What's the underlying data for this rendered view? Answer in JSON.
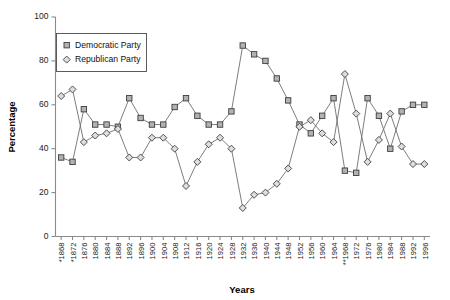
{
  "chart_data": {
    "type": "line",
    "title": "",
    "xlabel": "Years",
    "ylabel": "Percentage",
    "ylim": [
      0,
      100
    ],
    "yticks": [
      0,
      20,
      40,
      60,
      80,
      100
    ],
    "grid": false,
    "legend_position": "top-left",
    "categories": [
      "*1868",
      "*1872",
      "1876",
      "1880",
      "1884",
      "1888",
      "1892",
      "1896",
      "1900",
      "1904",
      "1908",
      "1912",
      "1916",
      "1920",
      "1924",
      "1928",
      "1932",
      "1936",
      "1940",
      "1944",
      "1948",
      "1952",
      "1956",
      "1960",
      "1964",
      "**1968",
      "1972",
      "1976",
      "1980",
      "1984",
      "1988",
      "1992",
      "1996"
    ],
    "series": [
      {
        "name": "Democratic Party",
        "marker": "square",
        "values": [
          36,
          34,
          58,
          51,
          51,
          50,
          63,
          54,
          51,
          51,
          59,
          63,
          55,
          51,
          51,
          57,
          87,
          83,
          80,
          72,
          62,
          51,
          47,
          55,
          63,
          30,
          29,
          63,
          55,
          40,
          57,
          60,
          60
        ]
      },
      {
        "name": "Republican Party",
        "marker": "diamond",
        "values": [
          64,
          67,
          43,
          46,
          47,
          49,
          36,
          36,
          45,
          45,
          40,
          23,
          34,
          42,
          45,
          40,
          13,
          19,
          20,
          24,
          31,
          50,
          53,
          47,
          43,
          74,
          56,
          34,
          44,
          56,
          41,
          33,
          33
        ]
      }
    ],
    "yaxis": {
      "min": 0,
      "max": 100
    }
  },
  "legend": {
    "entries": [
      {
        "label": "Democratic Party",
        "marker": "square"
      },
      {
        "label": "Republican Party",
        "marker": "diamond"
      }
    ]
  }
}
